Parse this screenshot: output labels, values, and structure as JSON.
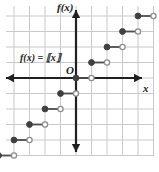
{
  "figure": {
    "kind": "coordinate-plane-graph",
    "background_color": "#ffffff",
    "grid_color": "#c9c9cf",
    "axis_color": "#231f20",
    "curve_color": "#4d4d4d",
    "closed_dot_color": "#404040",
    "open_dot_fill": "#ffffff",
    "open_dot_stroke": "#8c8c93"
  },
  "labels": {
    "y_axis": "f(x)",
    "x_axis": "x",
    "origin": "O",
    "equation": "f(x) = ⟦x⟧"
  },
  "chart_data": {
    "type": "line",
    "title": "",
    "subtitle": "",
    "xlabel": "x",
    "ylabel": "f(x)",
    "function_name": "floor",
    "function_label": "f(x) = ⟦x⟧",
    "xlim": [
      -5,
      5
    ],
    "ylim": [
      -5,
      5
    ],
    "grid": true,
    "grid_step": 1,
    "legend": "none",
    "axis_ticks_shown": false,
    "steps": [
      {
        "x_start": -5,
        "x_end": -4,
        "y": -5,
        "left_endpoint": "closed",
        "right_endpoint": "open"
      },
      {
        "x_start": -4,
        "x_end": -3,
        "y": -4,
        "left_endpoint": "closed",
        "right_endpoint": "open"
      },
      {
        "x_start": -3,
        "x_end": -2,
        "y": -3,
        "left_endpoint": "closed",
        "right_endpoint": "open"
      },
      {
        "x_start": -2,
        "x_end": -1,
        "y": -2,
        "left_endpoint": "closed",
        "right_endpoint": "open"
      },
      {
        "x_start": -1,
        "x_end": 0,
        "y": -1,
        "left_endpoint": "closed",
        "right_endpoint": "open"
      },
      {
        "x_start": 0,
        "x_end": 1,
        "y": 0,
        "left_endpoint": "closed",
        "right_endpoint": "open"
      },
      {
        "x_start": 1,
        "x_end": 2,
        "y": 1,
        "left_endpoint": "closed",
        "right_endpoint": "open"
      },
      {
        "x_start": 2,
        "x_end": 3,
        "y": 2,
        "left_endpoint": "closed",
        "right_endpoint": "open"
      },
      {
        "x_start": 3,
        "x_end": 4,
        "y": 3,
        "left_endpoint": "closed",
        "right_endpoint": "open"
      },
      {
        "x_start": 4,
        "x_end": 5,
        "y": 4,
        "left_endpoint": "closed",
        "right_endpoint": "open"
      }
    ],
    "annotations": [
      {
        "text": "f(x) = ⟦x⟧",
        "x": -3.6,
        "y": 1.6
      },
      {
        "text": "O",
        "x": -0.6,
        "y": 0.85
      }
    ]
  },
  "geometry": {
    "origin_px": {
      "x": 76,
      "y": 78
    },
    "unit_px": 15.5,
    "grid_rect": {
      "left": 6,
      "top": 6,
      "right": 153,
      "bottom": 156
    }
  }
}
